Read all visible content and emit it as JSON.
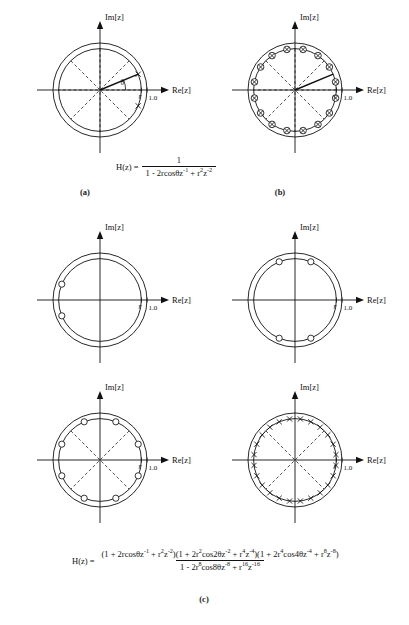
{
  "figure": {
    "type": "z-plane pole-zero diagrams",
    "axis_labels": {
      "real": "Re[z]",
      "imaginary": "Im[z]"
    },
    "tick_labels": {
      "radius": "r",
      "unit": "1.0"
    },
    "angle_label": "θ"
  },
  "captions": {
    "a": "(a)",
    "b": "(b)",
    "c": "(c)"
  },
  "equations": {
    "a": {
      "lhs": "H(z) =",
      "numerator": "1",
      "denominator_parts": [
        {
          "text": "1 - 2rcosθz"
        },
        {
          "sup": "-1"
        },
        {
          "text": " + r"
        },
        {
          "sup": "2"
        },
        {
          "text": "z"
        },
        {
          "sup": "-2"
        }
      ]
    },
    "c": {
      "lhs": "H(z) =",
      "numerator_parts": [
        {
          "text": "(1 + 2rcosθz"
        },
        {
          "sup": "-1"
        },
        {
          "text": " + r"
        },
        {
          "sup": "2"
        },
        {
          "text": "z"
        },
        {
          "sup": "-2"
        },
        {
          "text": ")(1 + 2r"
        },
        {
          "sup": "2"
        },
        {
          "text": "cos2θz"
        },
        {
          "sup": "-2"
        },
        {
          "text": " + r"
        },
        {
          "sup": "4"
        },
        {
          "text": "z"
        },
        {
          "sup": "-4"
        },
        {
          "text": ")(1 + 2r"
        },
        {
          "sup": "4"
        },
        {
          "text": "cos4θz"
        },
        {
          "sup": "-4"
        },
        {
          "text": " + r"
        },
        {
          "sup": "8"
        },
        {
          "text": "z"
        },
        {
          "sup": "-8"
        },
        {
          "text": ")"
        }
      ],
      "denominator_parts": [
        {
          "text": "1 - 2r"
        },
        {
          "sup": "8"
        },
        {
          "text": "cos8θz"
        },
        {
          "sup": "-8"
        },
        {
          "text": " + r"
        },
        {
          "sup": "16"
        },
        {
          "text": "z"
        },
        {
          "sup": "-16"
        }
      ]
    }
  },
  "chart_data": {
    "type": "scatter",
    "xlabel": "Re[z]",
    "ylabel": "Im[z]",
    "xlim": [
      -1.35,
      1.35
    ],
    "ylim": [
      -1.35,
      1.35
    ],
    "grid": false,
    "legend": "none",
    "common": {
      "unit_circle_radius": 1.0,
      "inner_circle_radius": 0.88,
      "marker_meaning": {
        "x": "pole",
        "circle": "zero",
        "circled-x": "pole and zero coincident"
      }
    },
    "panels": [
      {
        "id": "a",
        "caption": "(a)",
        "description": "Two-pole resonator: conjugate pole pair at radius r, angle ±θ, with 8 dashed radial spokes at 45° spacing",
        "spokes_deg": [
          0,
          45,
          90,
          135,
          180,
          225,
          270,
          315
        ],
        "spoke_style": "dashed",
        "angle_arc": {
          "label": "θ",
          "from_deg": 0,
          "to_deg": 22.5
        },
        "radius_vector_deg": 22.5,
        "markers": [
          {
            "type": "x",
            "radius": 0.88,
            "angle_deg": 22.5
          },
          {
            "type": "x",
            "radius": 0.88,
            "angle_deg": -22.5
          }
        ]
      },
      {
        "id": "b",
        "caption": "(b)",
        "description": "Sixteen coincident pole-zero pairs uniformly spaced at 22.5° around the circle of radius r",
        "spokes_deg": [
          0,
          45,
          90,
          135,
          180,
          225,
          270,
          315
        ],
        "spoke_style": "dashed",
        "radius_vector_deg": 22.5,
        "marker_count": 16,
        "marker_spacing_deg": 22.5,
        "marker_start_deg": 11.25,
        "marker_type": "circled-x",
        "marker_radius": 0.88
      },
      {
        "id": "c1",
        "caption": "",
        "description": "Two zeros near 180°, conjugate pair at ±θ about the negative real axis",
        "spokes_deg": [],
        "marker_type": "circle",
        "marker_radius": 0.88,
        "markers": [
          {
            "type": "circle",
            "radius": 0.88,
            "angle_deg": 157.5
          },
          {
            "type": "circle",
            "radius": 0.88,
            "angle_deg": 202.5
          }
        ]
      },
      {
        "id": "c2",
        "caption": "",
        "description": "Four zeros grouped near ±90°, two above and two below the real axis",
        "spokes_deg": [],
        "marker_type": "circle",
        "marker_radius": 0.88,
        "markers": [
          {
            "type": "circle",
            "radius": 0.88,
            "angle_deg": 67.5
          },
          {
            "type": "circle",
            "radius": 0.88,
            "angle_deg": 112.5
          },
          {
            "type": "circle",
            "radius": 0.88,
            "angle_deg": 247.5
          },
          {
            "type": "circle",
            "radius": 0.88,
            "angle_deg": 292.5
          }
        ]
      },
      {
        "id": "c3",
        "caption": "",
        "description": "Eight zeros uniformly spaced at 45° with four dashed diagonal spokes",
        "spokes_deg": [
          45,
          135,
          225,
          315
        ],
        "spoke_style": "dashed",
        "marker_type": "circle",
        "marker_radius": 0.88,
        "marker_count": 8,
        "marker_spacing_deg": 45,
        "marker_start_deg": 67.5
      },
      {
        "id": "c4",
        "caption": "",
        "description": "Twenty-four poles densely spaced around the circle with four dashed diagonal spokes",
        "spokes_deg": [
          45,
          135,
          225,
          315
        ],
        "spoke_style": "dashed",
        "marker_type": "x",
        "marker_radius": 0.88,
        "marker_count": 24,
        "marker_spacing_deg": 15,
        "marker_start_deg": 7.5
      }
    ]
  }
}
